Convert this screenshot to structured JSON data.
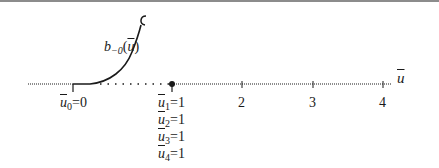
{
  "diagram": {
    "curve_label": {
      "base": "b",
      "subscript": "−0",
      "arg": "u"
    },
    "axis_label": "u",
    "ticks": [
      {
        "x": 73,
        "label": "",
        "value": 0
      },
      {
        "x": 172,
        "label": "",
        "value": 1
      },
      {
        "x": 242,
        "label": "2",
        "value": 2
      },
      {
        "x": 313,
        "label": "3",
        "value": 3
      },
      {
        "x": 383,
        "label": "4",
        "value": 4
      }
    ],
    "tick_labels": {
      "t2": "2",
      "t3": "3",
      "t4": "4"
    },
    "knot_labels": {
      "u0": {
        "var": "u",
        "sub": "0",
        "rhs": "=0"
      },
      "u1": {
        "var": "u",
        "sub": "1",
        "rhs": "=1"
      },
      "u2": {
        "var": "u",
        "sub": "2",
        "rhs": "=1"
      },
      "u3": {
        "var": "u",
        "sub": "3",
        "rhs": "=1"
      },
      "u4": {
        "var": "u",
        "sub": "4",
        "rhs": "=1"
      }
    },
    "colors": {
      "ink": "#1a1a1a",
      "frame": "#8c8c8c",
      "background": "#ffffff"
    }
  }
}
